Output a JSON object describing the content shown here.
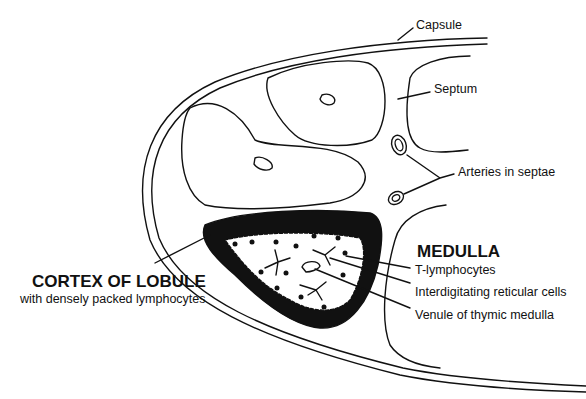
{
  "labels": {
    "capsule": "Capsule",
    "septum": "Septum",
    "arteries": "Arteries in septae",
    "medulla": "MEDULLA",
    "t_lymphocytes": "T-lymphocytes",
    "reticular": "Interdigitating reticular cells",
    "venule": "Venule of thymic medulla",
    "cortex": "CORTEX OF LOBULE",
    "cortex_sub": "with densely packed lymphocytes"
  },
  "colors": {
    "ink": "#111111",
    "background": "#ffffff"
  }
}
